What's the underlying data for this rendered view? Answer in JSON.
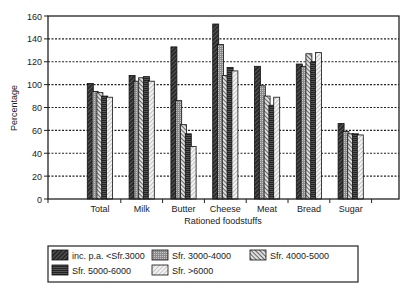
{
  "chart_data": {
    "type": "bar",
    "title": "",
    "xlabel": "Rationed foodstuffs",
    "ylabel": "Percentage",
    "ylim": [
      0,
      160
    ],
    "yticks": [
      0,
      20,
      40,
      60,
      80,
      100,
      120,
      140,
      160
    ],
    "grid": true,
    "legend_position": "bottom",
    "categories": [
      "Total",
      "Milk",
      "Butter",
      "Cheese",
      "Meat",
      "Bread",
      "Sugar"
    ],
    "series": [
      {
        "name": "inc. p.a. <Sfr.3000",
        "pattern": "dark-diagonal",
        "values": [
          101,
          108,
          133,
          153,
          116,
          118,
          66
        ]
      },
      {
        "name": "Sfr. 3000-4000",
        "pattern": "grey-dotted",
        "values": [
          94,
          103,
          86,
          135,
          99,
          116,
          59
        ]
      },
      {
        "name": "Sfr. 4000-5000",
        "pattern": "diagonal-hatch",
        "values": [
          93,
          106,
          65,
          108,
          90,
          127,
          57
        ]
      },
      {
        "name": "Sfr. 5000-6000",
        "pattern": "horizontal-lines",
        "values": [
          90,
          107,
          57,
          115,
          82,
          120,
          57
        ]
      },
      {
        "name": "Sfr. >6000",
        "pattern": "light-diagonal",
        "values": [
          89,
          103,
          46,
          112,
          89,
          128,
          56
        ]
      }
    ]
  }
}
